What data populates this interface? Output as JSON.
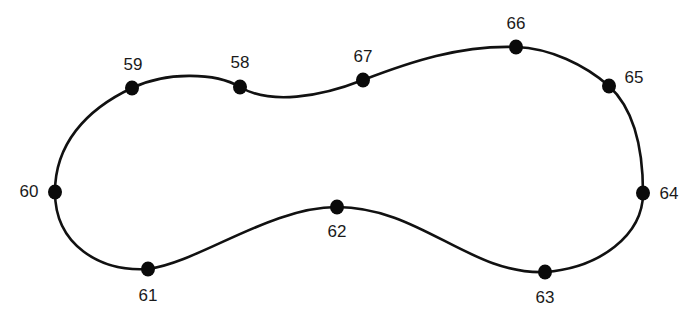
{
  "diagram": {
    "type": "closed-loop-path",
    "stroke_color": "#111111",
    "point_color": "#0a0a0a",
    "points": [
      {
        "id": "58",
        "label": "58",
        "x": 240,
        "y": 87,
        "label_x": 240,
        "label_y": 62
      },
      {
        "id": "59",
        "label": "59",
        "x": 132,
        "y": 88,
        "label_x": 133,
        "label_y": 64
      },
      {
        "id": "60",
        "label": "60",
        "x": 55,
        "y": 192,
        "label_x": 29,
        "label_y": 191
      },
      {
        "id": "61",
        "label": "61",
        "x": 148,
        "y": 269,
        "label_x": 148,
        "label_y": 295
      },
      {
        "id": "62",
        "label": "62",
        "x": 337,
        "y": 207,
        "label_x": 337,
        "label_y": 231
      },
      {
        "id": "63",
        "label": "63",
        "x": 545,
        "y": 272,
        "label_x": 545,
        "label_y": 297
      },
      {
        "id": "64",
        "label": "64",
        "x": 643,
        "y": 193,
        "label_x": 669,
        "label_y": 193
      },
      {
        "id": "65",
        "label": "65",
        "x": 609,
        "y": 86,
        "label_x": 634,
        "label_y": 77
      },
      {
        "id": "66",
        "label": "66",
        "x": 516,
        "y": 47,
        "label_x": 516,
        "label_y": 23
      },
      {
        "id": "67",
        "label": "67",
        "x": 363,
        "y": 80,
        "label_x": 363,
        "label_y": 56
      }
    ]
  }
}
